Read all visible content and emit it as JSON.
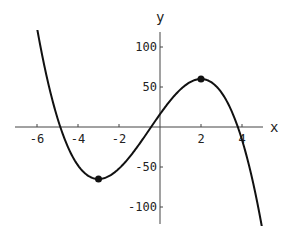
{
  "chart_data": {
    "type": "line",
    "title": "",
    "xlabel": "x",
    "ylabel": "y",
    "function": "f(x) = -2x^3 - 3x^2 + 36x + 16",
    "xlim": [
      -7,
      5
    ],
    "ylim": [
      -120,
      120
    ],
    "x_ticks": [
      -6,
      -4,
      -2,
      2,
      4
    ],
    "x_tick_labels": [
      "-6",
      "-4",
      "-2",
      "2",
      "4"
    ],
    "y_ticks": [
      -100,
      -50,
      50,
      100
    ],
    "y_tick_labels": [
      "-100",
      "-50",
      "50",
      "100"
    ],
    "grid": false,
    "series": [
      {
        "name": "f(x)",
        "x": [
          -6.05,
          -6,
          -5.5,
          -5,
          -4.5,
          -4,
          -3.5,
          -3,
          -2.5,
          -2,
          -1.5,
          -1,
          -0.5,
          0,
          0.5,
          1,
          1.5,
          2,
          2.5,
          3,
          3.5,
          4,
          4.5,
          5
        ],
        "y": [
          128,
          124,
          77.5,
          11,
          -31,
          -48,
          -61,
          -65,
          -61,
          -52,
          -39,
          -23,
          -2.5,
          16,
          33.5,
          47,
          56.5,
          60,
          56,
          43,
          19.5,
          -16,
          -66.5,
          -129
        ]
      }
    ],
    "marked_points": [
      {
        "label": "local minimum",
        "x": -3,
        "y": -65
      },
      {
        "label": "local maximum",
        "x": 2,
        "y": 60
      }
    ]
  }
}
